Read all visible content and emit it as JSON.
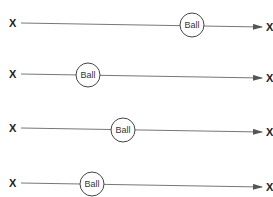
{
  "diagram": {
    "rows": [
      {
        "start_label": "X",
        "end_label": "X",
        "ball_label": "Ball",
        "y_start": 23,
        "y_end": 27,
        "ball_x": 192
      },
      {
        "start_label": "X",
        "end_label": "X",
        "ball_label": "Ball",
        "y_start": 74,
        "y_end": 78,
        "ball_x": 88
      },
      {
        "start_label": "X",
        "end_label": "X",
        "ball_label": "Ball",
        "y_start": 128,
        "y_end": 132,
        "ball_x": 123
      },
      {
        "start_label": "X",
        "end_label": "X",
        "ball_label": "Ball",
        "y_start": 183,
        "y_end": 187,
        "ball_x": 92
      }
    ],
    "colors": {
      "line": "#777777",
      "text": "#222222",
      "ball_stroke": "#444444"
    }
  }
}
